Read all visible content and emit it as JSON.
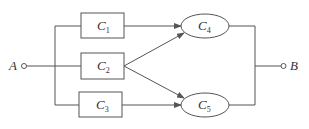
{
  "diagram": {
    "type": "network",
    "terminals": {
      "A": {
        "label": "A"
      },
      "B": {
        "label": "B"
      }
    },
    "nodes": [
      {
        "id": "C1",
        "shape": "rect",
        "label": "C",
        "sub": "1"
      },
      {
        "id": "C2",
        "shape": "rect",
        "label": "C",
        "sub": "2"
      },
      {
        "id": "C3",
        "shape": "rect",
        "label": "C",
        "sub": "3"
      },
      {
        "id": "C4",
        "shape": "ellipse",
        "label": "C",
        "sub": "4"
      },
      {
        "id": "C5",
        "shape": "ellipse",
        "label": "C",
        "sub": "5"
      }
    ],
    "edges": [
      {
        "from": "A",
        "to": "C1"
      },
      {
        "from": "A",
        "to": "C2"
      },
      {
        "from": "A",
        "to": "C3"
      },
      {
        "from": "C1",
        "to": "C4",
        "arrow": true
      },
      {
        "from": "C2",
        "to": "C4",
        "arrow": true
      },
      {
        "from": "C2",
        "to": "C5",
        "arrow": true
      },
      {
        "from": "C3",
        "to": "C5",
        "arrow": true
      },
      {
        "from": "C4",
        "to": "B"
      },
      {
        "from": "C5",
        "to": "B"
      }
    ],
    "colors": {
      "line": "#555555",
      "text": "#333333",
      "background": "#ffffff"
    }
  }
}
